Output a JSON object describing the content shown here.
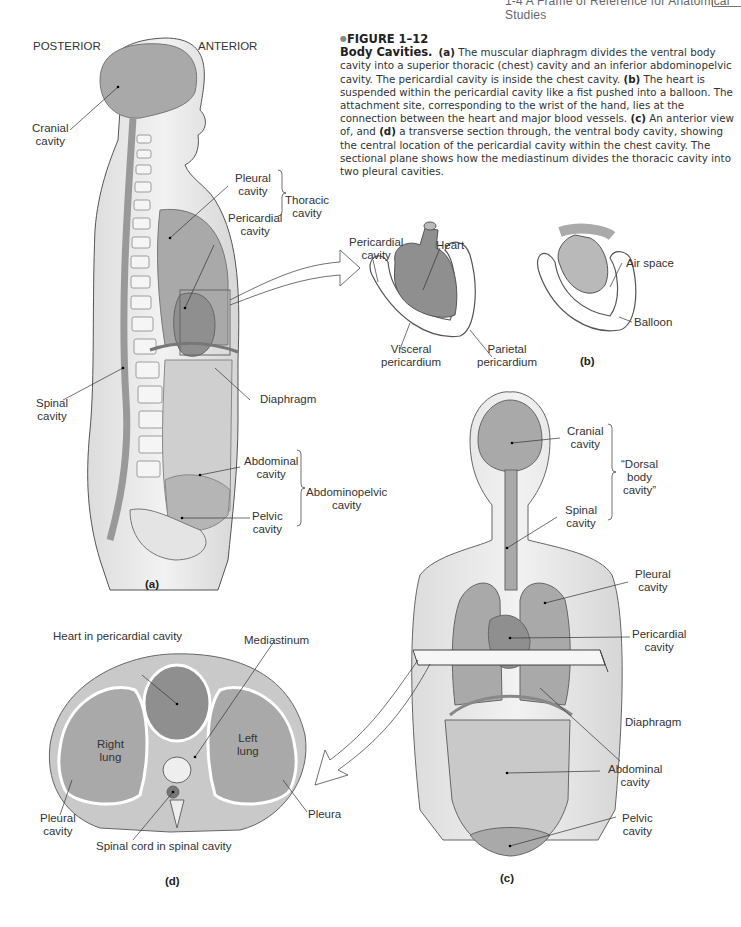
{
  "running_head": {
    "text": "1-4 A Frame of Reference for Anatomical Studies"
  },
  "caption": {
    "figure_number": "FIGURE 1–12",
    "title": "Body Cavities.",
    "segments": [
      {
        "bold": "(a)",
        "text": " The muscular diaphragm divides the ventral body cavity into a superior thoracic (chest) cavity and an inferior abdominopelvic cavity. The pericardial cavity is inside the chest cavity. "
      },
      {
        "bold": "(b)",
        "text": " The heart is suspended within the pericardial cavity like a fist pushed into a balloon. The attachment site, corresponding to the wrist of the hand, lies at the connection between the heart and major blood vessels. "
      },
      {
        "bold": "(c)",
        "text": " An anterior view of, and "
      },
      {
        "bold": "(d)",
        "text": " a transverse section through, the ventral body cavity, showing the central location of the pericardial cavity within the chest cavity. The sectional plane shows how the mediastinum divides the thoracic cavity into two pleural cavities."
      }
    ]
  },
  "panel_a": {
    "tag": "(a)",
    "orientation": {
      "posterior": "POSTERIOR",
      "anterior": "ANTERIOR"
    },
    "labels": {
      "cranial": [
        "Cranial",
        "cavity"
      ],
      "pleural": [
        "Pleural",
        "cavity"
      ],
      "pericardial": [
        "Pericardial",
        "cavity"
      ],
      "thoracic": [
        "Thoracic",
        "cavity"
      ],
      "spinal": [
        "Spinal",
        "cavity"
      ],
      "diaphragm": "Diaphragm",
      "abdominal": [
        "Abdominal",
        "cavity"
      ],
      "pelvic": [
        "Pelvic",
        "cavity"
      ],
      "abdominopelvic": [
        "Abdominopelvic",
        "cavity"
      ]
    }
  },
  "panel_b": {
    "tag": "(b)",
    "labels": {
      "pericardial": [
        "Pericardial",
        "cavity"
      ],
      "heart": "Heart",
      "visceral": [
        "Visceral",
        "pericardium"
      ],
      "parietal": [
        "Parietal",
        "pericardium"
      ],
      "air_space": "Air space",
      "balloon": "Balloon"
    }
  },
  "panel_c": {
    "tag": "(c)",
    "labels": {
      "cranial": [
        "Cranial",
        "cavity"
      ],
      "spinal": [
        "Spinal",
        "cavity"
      ],
      "dorsal": [
        "“Dorsal",
        "body",
        "cavity”"
      ],
      "pleural": [
        "Pleural",
        "cavity"
      ],
      "pericardial": [
        "Pericardial",
        "cavity"
      ],
      "diaphragm": "Diaphragm",
      "abdominal": [
        "Abdominal",
        "cavity"
      ],
      "pelvic": [
        "Pelvic",
        "cavity"
      ]
    }
  },
  "panel_d": {
    "tag": "(d)",
    "labels": {
      "heart": "Heart in pericardial cavity",
      "mediastinum": "Mediastinum",
      "right_lung": [
        "Right",
        "lung"
      ],
      "left_lung": [
        "Left",
        "lung"
      ],
      "pleural": [
        "Pleural",
        "cavity"
      ],
      "pleura": "Pleura",
      "spinal_cord": "Spinal cord in spinal cavity"
    }
  },
  "colors": {
    "cavity_fill": "#a9a9a9",
    "cavity_dark": "#8f8f8f",
    "skin_fill": "#ececec",
    "outline": "#555555",
    "text": "#333333"
  }
}
